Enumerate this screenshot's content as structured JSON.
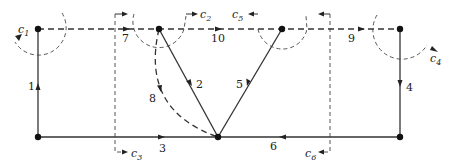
{
  "diagram": {
    "type": "network-graph-with-cut-sets",
    "nodes": [
      {
        "id": "n1",
        "x": 38,
        "y": 29
      },
      {
        "id": "n2",
        "x": 159,
        "y": 29
      },
      {
        "id": "n3",
        "x": 282,
        "y": 29
      },
      {
        "id": "n4",
        "x": 400,
        "y": 29
      },
      {
        "id": "n5",
        "x": 38,
        "y": 137
      },
      {
        "id": "n6",
        "x": 218,
        "y": 137
      },
      {
        "id": "n7",
        "x": 400,
        "y": 137
      }
    ],
    "edges": [
      {
        "label": "1",
        "from": "n5",
        "to": "n1",
        "style": "solid"
      },
      {
        "label": "2",
        "from": "n2",
        "to": "n6",
        "style": "solid"
      },
      {
        "label": "3",
        "from": "n5",
        "to": "n6",
        "style": "solid"
      },
      {
        "label": "4",
        "from": "n4",
        "to": "n7",
        "style": "solid"
      },
      {
        "label": "5",
        "from": "n3",
        "to": "n6",
        "style": "solid"
      },
      {
        "label": "6",
        "from": "n7",
        "to": "n6",
        "style": "solid"
      },
      {
        "label": "7",
        "from": "n1",
        "to": "n2",
        "style": "dashed"
      },
      {
        "label": "8",
        "from": "n2",
        "to": "n6",
        "style": "dashed"
      },
      {
        "label": "9",
        "from": "n3",
        "to": "n4",
        "style": "dashed"
      },
      {
        "label": "10",
        "from": "n2",
        "to": "n3",
        "style": "dashed"
      }
    ],
    "edge_labels": {
      "e1": "1",
      "e2": "2",
      "e3": "3",
      "e4": "4",
      "e5": "5",
      "e6": "6",
      "e7": "7",
      "e8": "8",
      "e9": "9",
      "e10": "10"
    },
    "cut_sets": {
      "c1": {
        "name": "c",
        "sub": "1"
      },
      "c2": {
        "name": "c",
        "sub": "2"
      },
      "c3": {
        "name": "c",
        "sub": "3"
      },
      "c4": {
        "name": "c",
        "sub": "4"
      },
      "c5": {
        "name": "c",
        "sub": "5"
      },
      "c6": {
        "name": "c",
        "sub": "6"
      }
    }
  }
}
